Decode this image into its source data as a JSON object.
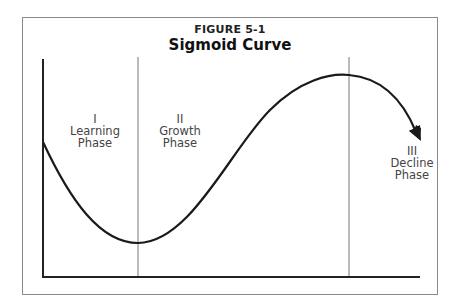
{
  "figure": {
    "number": "FIGURE 5-1",
    "title": "Sigmoid Curve"
  },
  "phases": [
    {
      "numeral": "I",
      "line1": "Learning",
      "line2": "Phase"
    },
    {
      "numeral": "II",
      "line1": "Growth",
      "line2": "Phase"
    },
    {
      "numeral": "III",
      "line1": "Decline",
      "line2": "Phase"
    }
  ],
  "colors": {
    "curve": "#1a1a1a",
    "axes": "#222222",
    "dividers": "#777777",
    "frame": "#8a8a8a",
    "text": "#444444"
  }
}
